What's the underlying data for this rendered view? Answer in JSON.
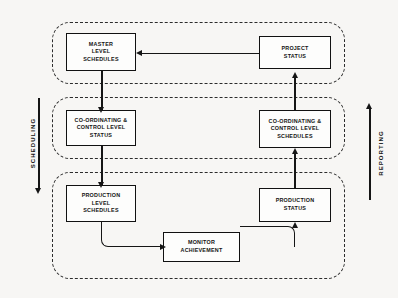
{
  "diagram": {
    "type": "block-flow-diagram",
    "background_color": "#f7f6f4",
    "line_color": "#151515",
    "lanes": [
      {
        "id": "master-lane",
        "name": "master-level-lane"
      },
      {
        "id": "coordinating-lane",
        "name": "coordinating-control-level-lane"
      },
      {
        "id": "production-lane",
        "name": "production-level-lane"
      }
    ],
    "nodes": [
      {
        "id": "master-level-schedules",
        "label": "MASTER\nLEVEL\nSCHEDULES",
        "lane": "master-lane",
        "column": "left"
      },
      {
        "id": "project-status",
        "label": "PROJECT\nSTATUS",
        "lane": "master-lane",
        "column": "right"
      },
      {
        "id": "coordinating-control-level-status",
        "label": "CO-ORDINATING &\nCONTROL LEVEL\nSTATUS",
        "lane": "coordinating-lane",
        "column": "left"
      },
      {
        "id": "coordinating-control-level-schedules",
        "label": "CO-ORDINATING &\nCONTROL LEVEL\nSCHEDULES",
        "lane": "coordinating-lane",
        "column": "right"
      },
      {
        "id": "production-level-schedules",
        "label": "PRODUCTION\nLEVEL\nSCHEDULES",
        "lane": "production-lane",
        "column": "left"
      },
      {
        "id": "production-status",
        "label": "PRODUCTION\nSTATUS",
        "lane": "production-lane",
        "column": "right"
      },
      {
        "id": "monitor-achievement",
        "label": "MONITOR\nACHIEVEMENT",
        "lane": "production-lane",
        "column": "center"
      }
    ],
    "edges": [
      {
        "from": "project-status",
        "to": "master-level-schedules",
        "direction": "left"
      },
      {
        "from": "master-level-schedules",
        "to": "coordinating-control-level-status",
        "direction": "down"
      },
      {
        "from": "coordinating-control-level-status",
        "to": "production-level-schedules",
        "direction": "down"
      },
      {
        "from": "production-level-schedules",
        "to": "monitor-achievement",
        "direction": "down-right"
      },
      {
        "from": "monitor-achievement",
        "to": "production-status",
        "direction": "right-up"
      },
      {
        "from": "production-status",
        "to": "coordinating-control-level-schedules",
        "direction": "up"
      },
      {
        "from": "coordinating-control-level-schedules",
        "to": "project-status",
        "direction": "up"
      }
    ],
    "axes": {
      "left": {
        "label": "SCHEDULING",
        "direction": "down"
      },
      "right": {
        "label": "REPORTING",
        "direction": "up"
      }
    }
  }
}
